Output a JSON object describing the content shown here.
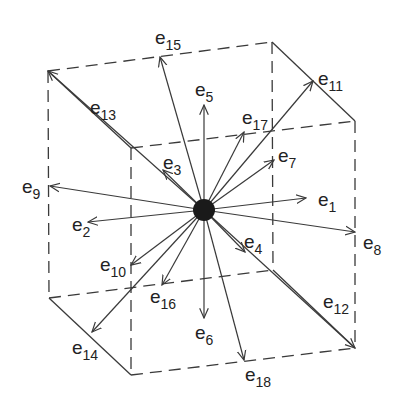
{
  "diagram": {
    "center": {
      "x": 204,
      "y": 210,
      "color": "#1a1a1a"
    },
    "line_color": "#3a3a3a",
    "cube_vertices": {
      "A": [
        48,
        71
      ],
      "B": [
        272,
        42
      ],
      "C": [
        355,
        121
      ],
      "D": [
        131,
        148
      ],
      "E": [
        49,
        298
      ],
      "F": [
        131,
        375
      ],
      "G": [
        355,
        348
      ],
      "H": [
        273,
        270
      ]
    },
    "vectors": [
      {
        "label": "e",
        "sub": "1",
        "to": [
          306,
          198
        ],
        "lx": 318,
        "ly": 190
      },
      {
        "label": "e",
        "sub": "2",
        "to": [
          88,
          222
        ],
        "lx": 72,
        "ly": 215
      },
      {
        "label": "e",
        "sub": "3",
        "to": [
          163,
          170
        ],
        "lx": 163,
        "ly": 153
      },
      {
        "label": "e",
        "sub": "4",
        "to": [
          245,
          252
        ],
        "lx": 244,
        "ly": 232
      },
      {
        "label": "e",
        "sub": "5",
        "to": [
          204,
          105
        ],
        "lx": 195,
        "ly": 80
      },
      {
        "label": "e",
        "sub": "6",
        "to": [
          204,
          318
        ],
        "lx": 195,
        "ly": 323
      },
      {
        "label": "e",
        "sub": "7",
        "to": [
          274,
          160
        ],
        "lx": 278,
        "ly": 146
      },
      {
        "label": "e",
        "sub": "8",
        "to": [
          355,
          232
        ],
        "lx": 363,
        "ly": 233
      },
      {
        "label": "e",
        "sub": "9",
        "to": [
          50,
          186
        ],
        "lx": 22,
        "ly": 177
      },
      {
        "label": "e",
        "sub": "10",
        "to": [
          131,
          265
        ],
        "lx": 100,
        "ly": 255
      },
      {
        "label": "e",
        "sub": "11",
        "to": [
          313,
          81
        ],
        "lx": 318,
        "ly": 69
      },
      {
        "label": "e",
        "sub": "12",
        "to": [
          355,
          348
        ],
        "lx": 323,
        "ly": 292
      },
      {
        "label": "e",
        "sub": "13",
        "to": [
          48,
          71
        ],
        "lx": 90,
        "ly": 98
      },
      {
        "label": "e",
        "sub": "14",
        "to": [
          92,
          332
        ],
        "lx": 72,
        "ly": 338
      },
      {
        "label": "e",
        "sub": "15",
        "to": [
          160,
          57
        ],
        "lx": 155,
        "ly": 28
      },
      {
        "label": "e",
        "sub": "16",
        "to": [
          162,
          285
        ],
        "lx": 150,
        "ly": 287
      },
      {
        "label": "e",
        "sub": "17",
        "to": [
          244,
          132
        ],
        "lx": 242,
        "ly": 108
      },
      {
        "label": "e",
        "sub": "18",
        "to": [
          244,
          360
        ],
        "lx": 245,
        "ly": 365
      }
    ]
  }
}
